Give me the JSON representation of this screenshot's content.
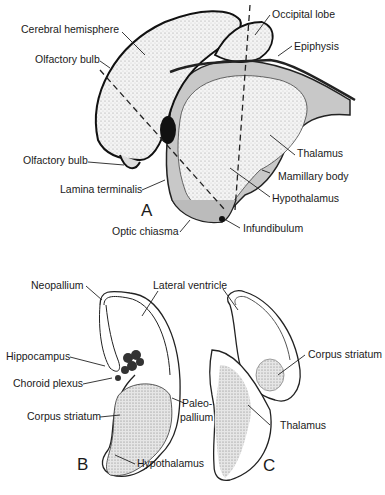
{
  "figure_a": {
    "letter": "A",
    "labels": {
      "cerebral_hemisphere": "Cerebral hemisphere",
      "olfactory_bulb_top": "Olfactory bulb",
      "olfactory_bulb_bottom": "Olfactory bulb",
      "lamina_terminalis": "Lamina terminalis",
      "optic_chiasma": "Optic chiasma",
      "occipital_lobe": "Occipital lobe",
      "epiphysis": "Epiphysis",
      "thalamus": "Thalamus",
      "mamillary_body": "Mamillary body",
      "hypothalamus": "Hypothalamus",
      "infundibulum": "Infundibulum"
    }
  },
  "figure_b": {
    "letter": "B",
    "labels": {
      "neopallium": "Neopallium",
      "lateral_ventricle": "Lateral ventricle",
      "hippocampus": "Hippocampus",
      "choroid_plexus": "Choroid plexus",
      "corpus_striatum": "Corpus striatum",
      "paleopallium_line1": "Paleo-",
      "paleopallium_line2": "pallium",
      "hypothalamus": "Hypothalamus"
    }
  },
  "figure_c": {
    "letter": "C",
    "labels": {
      "corpus_striatum": "Corpus striatum",
      "thalamus": "Thalamus"
    }
  }
}
